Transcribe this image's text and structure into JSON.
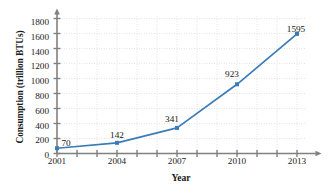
{
  "chart_data": {
    "type": "line",
    "title": "",
    "xlabel": "Year",
    "ylabel": "Consumption (trillion BTUs)",
    "x": [
      2001,
      2004,
      2007,
      2010,
      2013
    ],
    "values": [
      70,
      142,
      341,
      923,
      1595
    ],
    "point_labels": [
      "70",
      "142",
      "341",
      "923",
      "1595"
    ],
    "xlim": [
      2001,
      2013
    ],
    "ylim": [
      0,
      1900
    ],
    "x_tick_labels": [
      "2001",
      "2004",
      "2007",
      "2010",
      "2013"
    ],
    "x_minor_ticks": [
      2001,
      2002,
      2003,
      2004,
      2005,
      2006,
      2007,
      2008,
      2009,
      2010,
      2011,
      2012,
      2013
    ],
    "y_ticks": [
      0,
      200,
      400,
      600,
      800,
      1000,
      1200,
      1400,
      1600,
      1800
    ],
    "y_tick_labels": [
      "0",
      "200",
      "400",
      "600",
      "800",
      "1000",
      "1200",
      "1400",
      "1600",
      "1800"
    ],
    "grid": true,
    "legend": "none",
    "series_color": "#3a7cb8",
    "axis_color": "#808080",
    "grid_color": "#c8c8c8"
  }
}
